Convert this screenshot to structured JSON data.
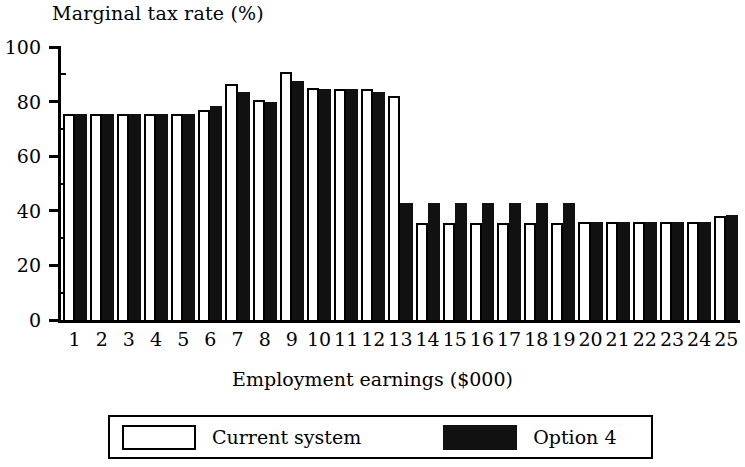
{
  "chart_data": {
    "type": "bar",
    "title": "",
    "ylabel": "Marginal tax rate (%)",
    "xlabel": "Employment earnings ($000)",
    "ylim": [
      0,
      100
    ],
    "ytick_labels": [
      "0",
      "20",
      "40",
      "60",
      "80",
      "100"
    ],
    "ytick_values": [
      0,
      20,
      40,
      60,
      80,
      100
    ],
    "yminor_step": 10,
    "grid": false,
    "legend_position": "bottom",
    "categories": [
      "1",
      "2",
      "3",
      "4",
      "5",
      "6",
      "7",
      "8",
      "9",
      "10",
      "11",
      "12",
      "13",
      "14",
      "15",
      "16",
      "17",
      "18",
      "19",
      "20",
      "21",
      "22",
      "23",
      "24",
      "25"
    ],
    "series": [
      {
        "name": "Current system",
        "color": "#ffffff",
        "edge_color": "#000000",
        "values": [
          75.5,
          75.5,
          75.5,
          75.5,
          75.5,
          77,
          86.5,
          80.5,
          91,
          85,
          84.5,
          84.5,
          82,
          35.5,
          35.5,
          35.5,
          35.5,
          35.5,
          35.5,
          36,
          36,
          36,
          36,
          36,
          38
        ]
      },
      {
        "name": "Option 4",
        "color": "#111111",
        "edge_color": "#111111",
        "values": [
          75.5,
          75.5,
          75.5,
          75.5,
          75.5,
          78.5,
          83.5,
          80,
          87.5,
          84.5,
          84.5,
          83.5,
          43,
          43,
          43,
          43,
          43,
          43,
          43,
          36,
          36,
          36,
          36,
          36,
          38.5
        ]
      }
    ]
  },
  "legend": {
    "entries": [
      {
        "label": "Current system",
        "swatch": "light-swatch"
      },
      {
        "label": "Option 4",
        "swatch": "dark-swatch"
      }
    ]
  }
}
